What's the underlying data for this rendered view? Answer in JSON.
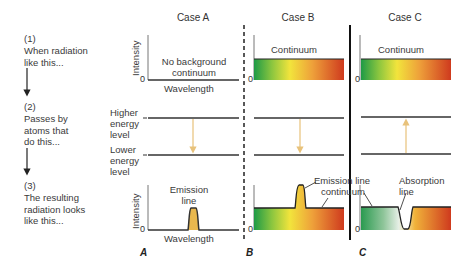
{
  "steps": [
    {
      "num": "(1)",
      "text": "When radiation\nlike this..."
    },
    {
      "num": "(2)",
      "text": "Passes by\natoms that\ndo this..."
    },
    {
      "num": "(3)",
      "text": "The resulting\nradiation looks\nlike this..."
    }
  ],
  "cases": [
    {
      "title": "Case A",
      "top_label": "No background\ncontinuum",
      "bottom_label": "Emission\nline",
      "transition": "down",
      "letter": "A"
    },
    {
      "title": "Case B",
      "top_label": "Continuum",
      "bottom_label": "Emission line",
      "bottom_label_2": "continuum",
      "transition": "down",
      "letter": "B"
    },
    {
      "title": "Case C",
      "top_label": "Continuum",
      "bottom_label": "Absorption\nline",
      "transition": "up",
      "letter": "C"
    }
  ],
  "axes": {
    "y_label": "Intensity",
    "x_label": "Wavelength",
    "zero": "0"
  },
  "energy_levels": {
    "higher": "Higher\nenergy\nlevel",
    "lower": "Lower\nenergy\nlevel"
  },
  "colors": {
    "spectrum_start": "#1e9a46",
    "spectrum_mid": "#f2e43c",
    "spectrum_end": "#cf3a1e",
    "emission_fill": "#e9b84e",
    "transition_arrow": "#e8c27a",
    "absorption_fade": "#e8efe8"
  }
}
